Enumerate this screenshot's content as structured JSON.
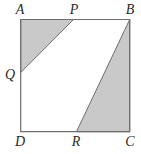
{
  "diagram": {
    "type": "geometry",
    "colors": {
      "stroke": "#6e6e6e",
      "shade": "#c9c9c9",
      "background": "#ffffff",
      "label": "#2a2a2a"
    },
    "points": {
      "A": {
        "label": "A",
        "x": 20.7,
        "y": 19.5
      },
      "B": {
        "label": "B",
        "x": 129.7,
        "y": 19.5
      },
      "C": {
        "label": "C",
        "x": 129.7,
        "y": 131.7
      },
      "D": {
        "label": "D",
        "x": 20.7,
        "y": 131.7
      },
      "P": {
        "label": "P",
        "x": 73.5,
        "y": 19.5
      },
      "Q": {
        "label": "Q",
        "x": 20.7,
        "y": 72.5
      },
      "R": {
        "label": "R",
        "x": 76.5,
        "y": 131.7
      }
    },
    "labels": [
      {
        "id": "A",
        "text": "A",
        "x": 20,
        "y": 14
      },
      {
        "id": "P",
        "text": "P",
        "x": 74,
        "y": 14
      },
      {
        "id": "B",
        "text": "B",
        "x": 130,
        "y": 14
      },
      {
        "id": "Q",
        "text": "Q",
        "x": 10,
        "y": 79
      },
      {
        "id": "D",
        "text": "D",
        "x": 20,
        "y": 146
      },
      {
        "id": "R",
        "text": "R",
        "x": 76,
        "y": 146
      },
      {
        "id": "C",
        "text": "C",
        "x": 130,
        "y": 146
      }
    ],
    "shaded_regions": [
      {
        "name": "triangle-APQ",
        "vertices": [
          "A",
          "P",
          "Q"
        ]
      },
      {
        "name": "triangle-BRC",
        "vertices": [
          "B",
          "R",
          "C"
        ]
      }
    ]
  }
}
